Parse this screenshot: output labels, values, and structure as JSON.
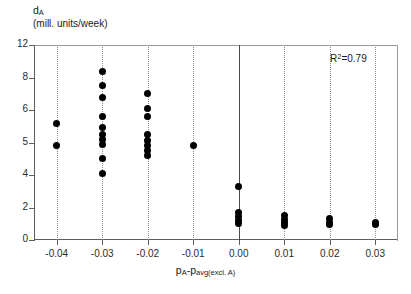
{
  "chart_data": {
    "type": "scatter",
    "title": "",
    "ylabel": "d_A (mill. units/week)",
    "ylabel_symbol": "d",
    "ylabel_symbol_sub": "A",
    "ylabel_units": "(mill. units/week)",
    "xlabel": "p_A - p_avg(excl. A)",
    "xlabel_lead": "p",
    "xlabel_lead_sub": "A",
    "xlabel_mid": "-p",
    "xlabel_tail_sub": "avg(excl. A)",
    "annotation": "R²=0.79",
    "annotation_base": "R",
    "annotation_sup": "2",
    "annotation_value": "=0.79",
    "r_squared": 0.79,
    "grid": "vertical-dotted",
    "legend": "none",
    "xlim": [
      -0.045,
      0.035
    ],
    "ylim": [
      0,
      12
    ],
    "xticks": [
      -0.04,
      -0.03,
      -0.02,
      -0.01,
      0.0,
      0.01,
      0.02,
      0.03
    ],
    "xtick_labels": [
      "-0.04",
      "-0.03",
      "-0.02",
      "-0.01",
      "0.00",
      "0.01",
      "0.02",
      "0.03"
    ],
    "yticks": [
      0,
      2,
      4,
      5,
      6,
      8,
      12
    ],
    "ytick_labels": [
      "0",
      "2",
      "4",
      "5",
      "6",
      "8",
      "12"
    ],
    "ytick_note": "tick labels are evenly spaced on the axis although values are non-uniform",
    "zero_reference_line_x": 0.0,
    "points": [
      {
        "x": -0.04,
        "y": 5.6
      },
      {
        "x": -0.04,
        "y": 4.9
      },
      {
        "x": -0.03,
        "y": 8.7
      },
      {
        "x": -0.03,
        "y": 7.5
      },
      {
        "x": -0.03,
        "y": 6.8
      },
      {
        "x": -0.03,
        "y": 5.8
      },
      {
        "x": -0.03,
        "y": 5.45
      },
      {
        "x": -0.03,
        "y": 5.25
      },
      {
        "x": -0.03,
        "y": 5.1
      },
      {
        "x": -0.03,
        "y": 4.95
      },
      {
        "x": -0.03,
        "y": 4.5
      },
      {
        "x": -0.03,
        "y": 4.05
      },
      {
        "x": -0.02,
        "y": 7.0
      },
      {
        "x": -0.02,
        "y": 6.1
      },
      {
        "x": -0.02,
        "y": 5.8
      },
      {
        "x": -0.02,
        "y": 5.25
      },
      {
        "x": -0.02,
        "y": 5.05
      },
      {
        "x": -0.02,
        "y": 4.9
      },
      {
        "x": -0.02,
        "y": 4.75
      },
      {
        "x": -0.02,
        "y": 4.6
      },
      {
        "x": -0.01,
        "y": 4.9
      },
      {
        "x": 0.0,
        "y": 3.3
      },
      {
        "x": 0.0,
        "y": 1.7
      },
      {
        "x": 0.0,
        "y": 1.45
      },
      {
        "x": 0.0,
        "y": 1.2
      },
      {
        "x": 0.0,
        "y": 1.0
      },
      {
        "x": 0.01,
        "y": 1.5
      },
      {
        "x": 0.01,
        "y": 1.25
      },
      {
        "x": 0.01,
        "y": 1.05
      },
      {
        "x": 0.01,
        "y": 0.9
      },
      {
        "x": 0.02,
        "y": 1.3
      },
      {
        "x": 0.02,
        "y": 1.1
      },
      {
        "x": 0.02,
        "y": 0.95
      },
      {
        "x": 0.03,
        "y": 1.1
      },
      {
        "x": 0.03,
        "y": 0.95
      }
    ]
  }
}
